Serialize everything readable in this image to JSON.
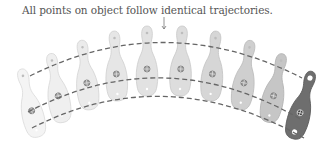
{
  "caption": "All points on object follow identical trajectories.",
  "diagram": {
    "object": "bowling-pin",
    "pin_count": 10,
    "pins": [
      {
        "cx": 30,
        "cy": 104,
        "angle": -14,
        "fill": "#f4f4f4",
        "stroke": "#dcdcdc"
      },
      {
        "cx": 57,
        "cy": 89,
        "angle": -10,
        "fill": "#efefef",
        "stroke": "#d8d8d8"
      },
      {
        "cx": 86,
        "cy": 76,
        "angle": -7,
        "fill": "#ebebeb",
        "stroke": "#d4d4d4"
      },
      {
        "cx": 116,
        "cy": 67,
        "angle": -3,
        "fill": "#e6e6e6",
        "stroke": "#d0d0d0"
      },
      {
        "cx": 147,
        "cy": 62,
        "angle": 0,
        "fill": "#e2e2e2",
        "stroke": "#cccccc"
      },
      {
        "cx": 181,
        "cy": 62,
        "angle": 2,
        "fill": "#dddddd",
        "stroke": "#c8c8c8"
      },
      {
        "cx": 213,
        "cy": 67,
        "angle": 5,
        "fill": "#d6d6d6",
        "stroke": "#c2c2c2"
      },
      {
        "cx": 245,
        "cy": 76,
        "angle": 9,
        "fill": "#cfcfcf",
        "stroke": "#bbbbbb"
      },
      {
        "cx": 275,
        "cy": 89,
        "angle": 12,
        "fill": "#c6c6c6",
        "stroke": "#b2b2b2"
      },
      {
        "cx": 302,
        "cy": 106,
        "angle": 16,
        "fill": "#6e6e6e",
        "stroke": "#5a5a5a"
      }
    ],
    "trajectories": [
      {
        "name": "top-point",
        "path": "M 30 76 Q 165 8 302 78"
      },
      {
        "name": "center-point",
        "path": "M 28 112 Q 165 40 302 120"
      },
      {
        "name": "bottom-point",
        "path": "M 32 128 Q 165 60 304 138"
      }
    ],
    "annotation_arrow": {
      "x": 164,
      "y1": 17,
      "y2": 29
    },
    "colors": {
      "dashed_line": "#666666",
      "text": "#555555",
      "highlight_pin": "#6e6e6e"
    }
  }
}
